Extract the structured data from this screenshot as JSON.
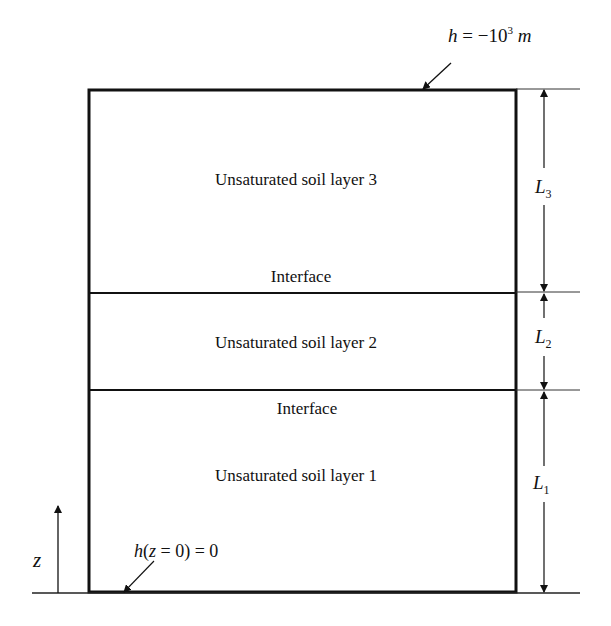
{
  "diagram": {
    "type": "soil-profile",
    "top_boundary": {
      "var": "h",
      "eq": " = −10",
      "exp": "3",
      "unit": " m"
    },
    "bottom_boundary": {
      "text_pre": "h",
      "text_paren": "(",
      "var_z": "z",
      "text_mid": " = 0) = 0"
    },
    "axis_label": "z",
    "layers": [
      {
        "label": "Unsaturated soil layer 3",
        "dim_var": "L",
        "dim_sub": "3"
      },
      {
        "label": "Unsaturated soil layer 2",
        "dim_var": "L",
        "dim_sub": "2"
      },
      {
        "label": "Unsaturated soil layer 1",
        "dim_var": "L",
        "dim_sub": "1"
      }
    ],
    "interfaces": [
      {
        "label": "Interface"
      },
      {
        "label": "Interface"
      }
    ],
    "colors": {
      "line": "#111111",
      "background": "#ffffff"
    }
  }
}
